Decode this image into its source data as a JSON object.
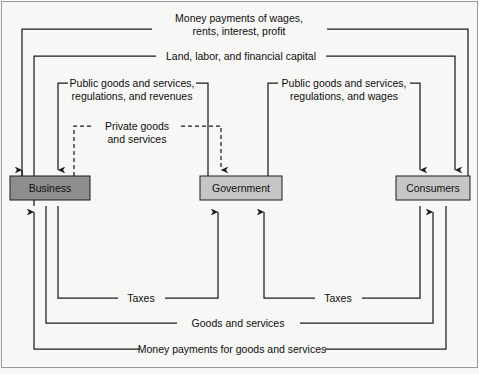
{
  "diagram": {
    "background_color": "#f7f7f5",
    "line_color": "#1d1d1d",
    "frame_color": "#9a9a9a"
  },
  "nodes": [
    {
      "id": "business",
      "label": "Business",
      "fill": "#8e8e8e",
      "x": 10,
      "y": 176,
      "w": 80,
      "h": 24
    },
    {
      "id": "government",
      "label": "Government",
      "fill": "#c6c6c6",
      "x": 200,
      "y": 176,
      "w": 82,
      "h": 24
    },
    {
      "id": "consumers",
      "label": "Consumers",
      "fill": "#c6c6c6",
      "x": 396,
      "y": 176,
      "w": 74,
      "h": 24
    }
  ],
  "flows": [
    {
      "id": "money-payments-wages",
      "label_line1": "Money payments of wages,",
      "label_line2": "rents, interest, profit",
      "from": "consumers",
      "to": "business",
      "style": "solid"
    },
    {
      "id": "land-labor-capital",
      "label_line1": "Land, labor, and financial capital",
      "label_line2": "",
      "from": "business",
      "to": "consumers",
      "style": "solid"
    },
    {
      "id": "public-goods-business",
      "label_line1": "Public goods and services,",
      "label_line2": "regulations, and revenues",
      "from": "government",
      "to": "business",
      "style": "solid"
    },
    {
      "id": "public-goods-consumers",
      "label_line1": "Public goods and services,",
      "label_line2": "regulations, and wages",
      "from": "government",
      "to": "consumers",
      "style": "solid"
    },
    {
      "id": "private-goods",
      "label_line1": "Private goods",
      "label_line2": "and services",
      "from": "business",
      "to": "government",
      "style": "dashed"
    },
    {
      "id": "taxes-business",
      "label_line1": "Taxes",
      "label_line2": "",
      "from": "business",
      "to": "government",
      "style": "solid"
    },
    {
      "id": "taxes-consumers",
      "label_line1": "Taxes",
      "label_line2": "",
      "from": "consumers",
      "to": "government",
      "style": "solid"
    },
    {
      "id": "goods-and-services",
      "label_line1": "Goods and services",
      "label_line2": "",
      "from": "business",
      "to": "consumers",
      "style": "solid"
    },
    {
      "id": "money-payments-goods",
      "label_line1": "Money payments for goods and services",
      "label_line2": "",
      "from": "consumers",
      "to": "business",
      "style": "solid"
    }
  ],
  "labels": {
    "money_wages_l1": "Money payments of wages,",
    "money_wages_l2": "rents, interest, profit",
    "land_labor": "Land, labor, and financial capital",
    "public_biz_l1": "Public goods and services,",
    "public_biz_l2": "regulations, and revenues",
    "public_cons_l1": "Public goods and services,",
    "public_cons_l2": "regulations, and wages",
    "private_l1": "Private goods",
    "private_l2": "and services",
    "taxes_left": "Taxes",
    "taxes_right": "Taxes",
    "goods_services": "Goods and services",
    "money_goods": "Money payments for goods and services"
  }
}
